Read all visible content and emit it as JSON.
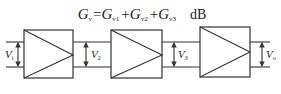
{
  "equation": {
    "lhs": "G",
    "lhs_sub": "v",
    "equals": "=",
    "terms": [
      {
        "symbol": "G",
        "sub": "v1"
      },
      {
        "symbol": "G",
        "sub": "v2"
      },
      {
        "symbol": "G",
        "sub": "v3"
      }
    ],
    "plus": "+",
    "unit": "dB"
  },
  "stages": [
    {
      "name": "amplifier-stage-1"
    },
    {
      "name": "amplifier-stage-2"
    },
    {
      "name": "amplifier-stage-3"
    }
  ],
  "voltages": [
    {
      "symbol": "V",
      "sub": "i"
    },
    {
      "symbol": "V",
      "sub": "2"
    },
    {
      "symbol": "V",
      "sub": "3"
    },
    {
      "symbol": "V",
      "sub": "o"
    }
  ]
}
